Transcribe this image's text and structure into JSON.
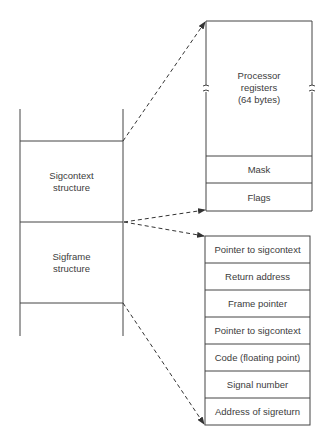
{
  "left_stack": {
    "sigcontext_label_line1": "Sigcontext",
    "sigcontext_label_line2": "structure",
    "sigframe_label_line1": "Sigframe",
    "sigframe_label_line2": "structure"
  },
  "sigcontext_detail": {
    "registers_line1": "Processor",
    "registers_line2": "registers",
    "registers_line3": "(64 bytes)",
    "rows": [
      "Mask",
      "Flags"
    ]
  },
  "sigframe_detail": {
    "rows": [
      "Pointer to sigcontext",
      "Return address",
      "Frame pointer",
      "Pointer to sigcontext",
      "Code (floating point)",
      "Signal number",
      "Address of sigreturn"
    ]
  },
  "colors": {
    "line": "#444444",
    "text": "#3c3c3c",
    "background": "#ffffff"
  }
}
